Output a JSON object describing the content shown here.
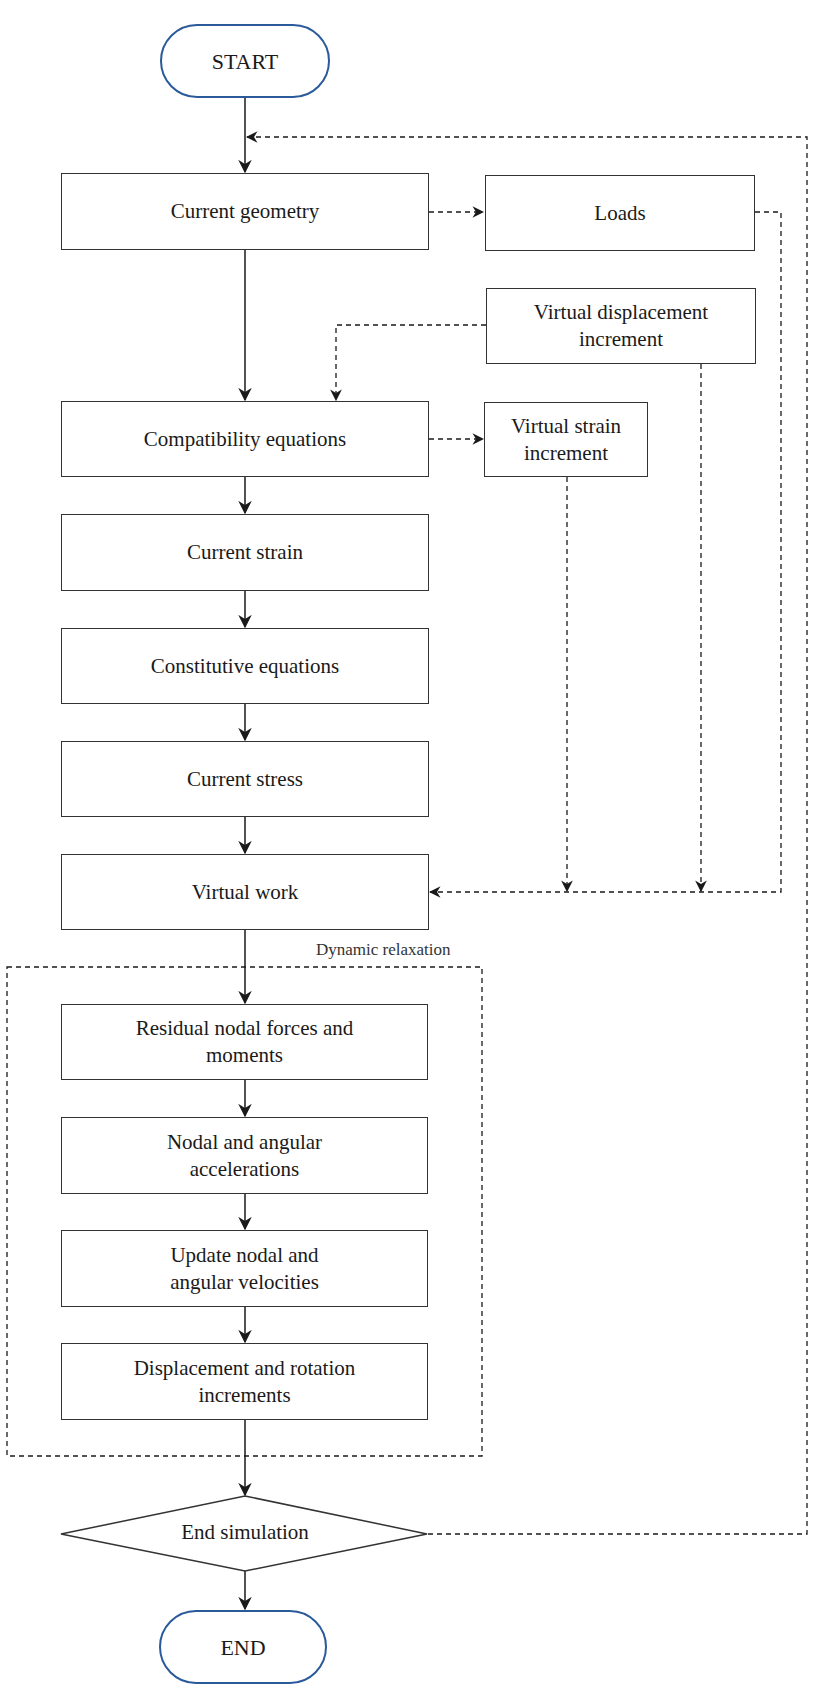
{
  "diagram": {
    "type": "flowchart",
    "colors": {
      "terminal_border": "#2a5a9a",
      "box_border": "#333333",
      "line": "#1a1a1a"
    },
    "terminals": {
      "start": "START",
      "end": "END"
    },
    "main_steps": [
      {
        "id": "current-geometry",
        "label": "Current geometry"
      },
      {
        "id": "compatibility-equations",
        "label": "Compatibility equations"
      },
      {
        "id": "current-strain",
        "label": "Current strain"
      },
      {
        "id": "constitutive-equations",
        "label": "Constitutive equations"
      },
      {
        "id": "current-stress",
        "label": "Current stress"
      },
      {
        "id": "virtual-work",
        "label": "Virtual work"
      }
    ],
    "side_steps": {
      "loads": "Loads",
      "virtual_displacement_increment": "Virtual displacement increment",
      "virtual_strain_increment": "Virtual strain increment"
    },
    "dynamic_relaxation": {
      "label": "Dynamic relaxation",
      "steps": [
        {
          "id": "residual",
          "label": "Residual nodal forces and moments"
        },
        {
          "id": "accelerations",
          "label": "Nodal and angular accelerations"
        },
        {
          "id": "velocities",
          "label": "Update nodal and angular velocities"
        },
        {
          "id": "increments",
          "label": "Displacement and rotation increments"
        }
      ]
    },
    "decision": {
      "label": "End simulation"
    }
  }
}
